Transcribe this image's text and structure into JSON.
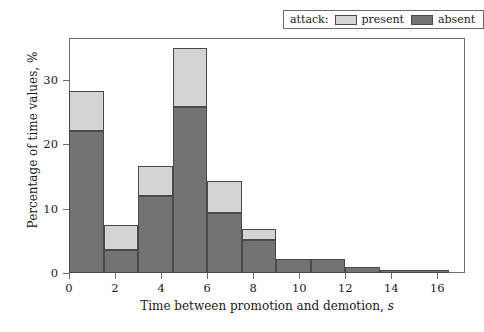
{
  "chart_data": {
    "type": "bar",
    "subtype": "stacked-histogram",
    "title": "",
    "xlabel": "Time between promotion and demotion, s",
    "xlabel_plain": "Time between promotion and demotion,",
    "xlabel_italic_suffix": "s",
    "ylabel": "Percentage of time values, %",
    "xlim": [
      0,
      17.2
    ],
    "ylim": [
      0,
      36.5
    ],
    "xticks": [
      0,
      2,
      4,
      6,
      8,
      10,
      12,
      14,
      16
    ],
    "xtick_labels": [
      "0",
      "2",
      "4",
      "6",
      "8",
      "10",
      "12",
      "14",
      "16"
    ],
    "yticks": [
      0,
      10,
      20,
      30
    ],
    "ytick_labels": [
      "0",
      "10",
      "20",
      "30"
    ],
    "grid": false,
    "legend": {
      "position": "top-right-outside",
      "title": "attack:",
      "entries": [
        {
          "name": "present",
          "color": "#d4d4d4"
        },
        {
          "name": "absent",
          "color": "#737373"
        }
      ]
    },
    "bin_edges": [
      0,
      1.5,
      3.0,
      4.5,
      6.0,
      7.5,
      9.0,
      10.5,
      12.0,
      13.5,
      16.5
    ],
    "series": [
      {
        "name": "absent",
        "color": "#737373",
        "values": [
          22.0,
          3.5,
          12.0,
          25.8,
          9.3,
          5.2,
          2.2,
          2.1,
          1.0,
          0.5
        ]
      },
      {
        "name": "present",
        "color": "#d4d4d4",
        "values": [
          6.3,
          3.9,
          4.6,
          9.1,
          5.0,
          1.6,
          0.0,
          0.0,
          0.0,
          0.0
        ]
      }
    ],
    "totals": [
      28.3,
      7.4,
      16.6,
      34.9,
      14.3,
      6.8,
      2.2,
      2.1,
      1.0,
      0.5
    ],
    "bars": [
      {
        "x0": 0.0,
        "x1": 1.5,
        "absent": 22.0,
        "present": 6.3,
        "total": 28.3
      },
      {
        "x0": 1.5,
        "x1": 3.0,
        "absent": 3.5,
        "present": 3.9,
        "total": 7.4
      },
      {
        "x0": 3.0,
        "x1": 4.5,
        "absent": 12.0,
        "present": 4.6,
        "total": 16.6
      },
      {
        "x0": 4.5,
        "x1": 6.0,
        "absent": 25.8,
        "present": 9.1,
        "total": 34.9
      },
      {
        "x0": 6.0,
        "x1": 7.5,
        "absent": 9.3,
        "present": 5.0,
        "total": 14.3
      },
      {
        "x0": 7.5,
        "x1": 9.0,
        "absent": 5.2,
        "present": 1.6,
        "total": 6.8
      },
      {
        "x0": 9.0,
        "x1": 10.5,
        "absent": 2.2,
        "present": 0.0,
        "total": 2.2
      },
      {
        "x0": 10.5,
        "x1": 12.0,
        "absent": 2.1,
        "present": 0.0,
        "total": 2.1
      },
      {
        "x0": 12.0,
        "x1": 13.5,
        "absent": 1.0,
        "present": 0.0,
        "total": 1.0
      },
      {
        "x0": 13.5,
        "x1": 16.5,
        "absent": 0.5,
        "present": 0.0,
        "total": 0.5
      }
    ],
    "colors": {
      "present": "#d4d4d4",
      "absent": "#737373",
      "edge": "#4a4a4a",
      "axis": "#6f6f6f",
      "background": "#ffffff",
      "text": "#1a1a1a"
    }
  }
}
